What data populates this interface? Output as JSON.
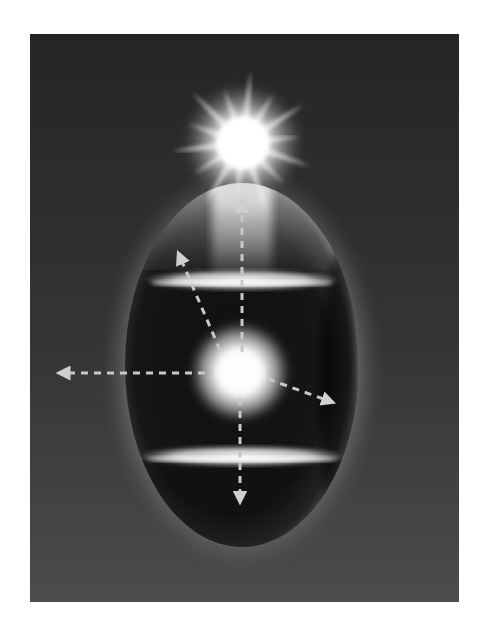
{
  "figure": {
    "colors": {
      "page_background": "#ffffff",
      "panel_top": "#262626",
      "panel_bottom": "#4a4a4a",
      "ellipsoid_dark": "#141414",
      "glow": "#ffffff",
      "arrow": "#c8c8c8"
    },
    "panel": {
      "x": 30,
      "y": 34,
      "width": 429,
      "height": 568
    },
    "ellipsoid": {
      "cx": 242,
      "cy": 365,
      "rx": 117,
      "ry": 182
    },
    "star": {
      "cx": 243,
      "cy": 143,
      "rays": 14
    },
    "orb": {
      "cx": 240,
      "cy": 372,
      "r": 32
    },
    "bands": [
      {
        "name": "upper-band",
        "cy": 280,
        "rx": 95,
        "ry": 10
      },
      {
        "name": "lower-band",
        "cy": 456,
        "rx": 100,
        "ry": 10
      }
    ],
    "arrows": [
      {
        "name": "arrow-up",
        "x1": 242,
        "y1": 352,
        "x2": 242,
        "y2": 205
      },
      {
        "name": "arrow-upper-left",
        "x1": 220,
        "y1": 350,
        "x2": 180,
        "y2": 257
      },
      {
        "name": "arrow-left",
        "x1": 205,
        "y1": 373,
        "x2": 63,
        "y2": 373
      },
      {
        "name": "arrow-lower-right",
        "x1": 268,
        "y1": 379,
        "x2": 329,
        "y2": 401
      },
      {
        "name": "arrow-down",
        "x1": 240,
        "y1": 398,
        "x2": 240,
        "y2": 498
      }
    ]
  }
}
